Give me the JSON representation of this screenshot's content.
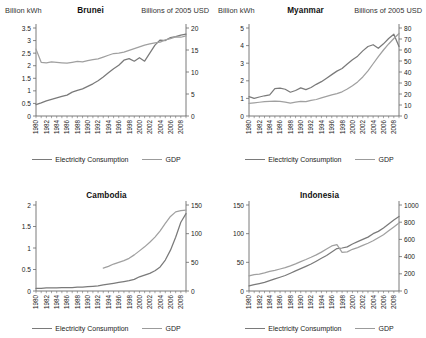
{
  "figure": {
    "axis_unit_left": "Billion kWh",
    "axis_unit_right": "Billions of 2005 USD",
    "legend": {
      "series_1": "Electricity Consumption",
      "series_2": "GDP"
    },
    "colors": {
      "electricity": "#7a7a7a",
      "gdp": "#a0a0a0",
      "axis": "#6b6b6b",
      "text": "#222222",
      "background": "#ffffff"
    }
  },
  "chart_data": [
    {
      "type": "line",
      "title": "Brunei",
      "xlabel": "",
      "ylabel": "Billion kWh",
      "y2label": "Billions of 2005 USD",
      "grid": false,
      "legend_position": "bottom",
      "x": [
        1980,
        1981,
        1982,
        1983,
        1984,
        1985,
        1986,
        1987,
        1988,
        1989,
        1990,
        1991,
        1992,
        1993,
        1994,
        1995,
        1996,
        1997,
        1998,
        1999,
        2000,
        2001,
        2002,
        2003,
        2004,
        2005,
        2006,
        2007,
        2008,
        2009
      ],
      "xticklabels": [
        "1980",
        "1982",
        "1984",
        "1986",
        "1988",
        "1990",
        "1992",
        "1994",
        "1996",
        "1998",
        "2000",
        "2002",
        "2004",
        "2006",
        "2008"
      ],
      "ylim": [
        0,
        3.5
      ],
      "yticks": [
        0,
        0.5,
        1,
        1.5,
        2,
        2.5,
        3,
        3.5
      ],
      "yticklabels": [
        "0",
        "0.5",
        "1",
        "1.5",
        "2",
        "2.5",
        "3",
        "3.5"
      ],
      "y2lim": [
        0,
        20
      ],
      "y2ticks": [
        0,
        5,
        10,
        15,
        20
      ],
      "y2ticklabels": [
        "0",
        "5",
        "10",
        "15",
        "20"
      ],
      "series": [
        {
          "name": "Electricity Consumption",
          "axis": "left",
          "values": [
            0.45,
            0.52,
            0.6,
            0.66,
            0.72,
            0.78,
            0.83,
            0.95,
            1.02,
            1.08,
            1.18,
            1.28,
            1.4,
            1.55,
            1.72,
            1.88,
            2.02,
            2.22,
            2.28,
            2.18,
            2.32,
            2.18,
            2.5,
            2.82,
            3.02,
            3.0,
            3.12,
            3.16,
            3.22,
            3.26
          ]
        },
        {
          "name": "GDP",
          "axis": "right",
          "values": [
            15.2,
            12.2,
            12.1,
            12.3,
            12.2,
            12.1,
            12.0,
            12.2,
            12.4,
            12.3,
            12.6,
            12.8,
            13.0,
            13.4,
            13.8,
            14.2,
            14.3,
            14.5,
            14.9,
            15.3,
            15.7,
            16.1,
            16.4,
            16.6,
            16.8,
            17.3,
            17.6,
            18.0,
            17.9,
            18.2
          ]
        }
      ]
    },
    {
      "type": "line",
      "title": "Myanmar",
      "xlabel": "",
      "ylabel": "Billion kWh",
      "y2label": "Billions of 2005 USD",
      "grid": false,
      "legend_position": "bottom",
      "x": [
        1980,
        1981,
        1982,
        1983,
        1984,
        1985,
        1986,
        1987,
        1988,
        1989,
        1990,
        1991,
        1992,
        1993,
        1994,
        1995,
        1996,
        1997,
        1998,
        1999,
        2000,
        2001,
        2002,
        2003,
        2004,
        2005,
        2006,
        2007,
        2008,
        2009
      ],
      "xticklabels": [
        "1980",
        "1982",
        "1984",
        "1986",
        "1988",
        "1990",
        "1992",
        "1994",
        "1996",
        "1998",
        "2000",
        "2002",
        "2004",
        "2006",
        "2008"
      ],
      "ylim": [
        0,
        5
      ],
      "yticks": [
        0,
        1,
        2,
        3,
        4,
        5
      ],
      "yticklabels": [
        "0",
        "1",
        "2",
        "3",
        "4",
        "5"
      ],
      "y2lim": [
        0,
        80
      ],
      "y2ticks": [
        0,
        10,
        20,
        30,
        40,
        50,
        60,
        70,
        80
      ],
      "y2ticklabels": [
        "0",
        "10",
        "20",
        "30",
        "40",
        "50",
        "60",
        "70",
        "80"
      ],
      "series": [
        {
          "name": "Electricity Consumption",
          "axis": "left",
          "values": [
            1.1,
            1.0,
            1.08,
            1.15,
            1.2,
            1.55,
            1.58,
            1.52,
            1.35,
            1.45,
            1.6,
            1.5,
            1.62,
            1.8,
            1.95,
            2.15,
            2.35,
            2.55,
            2.7,
            2.95,
            3.2,
            3.4,
            3.7,
            3.95,
            4.05,
            3.85,
            4.1,
            4.4,
            4.65,
            3.95
          ]
        },
        {
          "name": "GDP",
          "axis": "right",
          "values": [
            11.5,
            12.0,
            12.5,
            13.0,
            13.4,
            13.6,
            13.2,
            12.6,
            11.8,
            12.6,
            13.2,
            13.0,
            14.2,
            15.0,
            16.4,
            17.8,
            19.2,
            20.4,
            22.0,
            24.5,
            27.5,
            31.0,
            35.5,
            41.0,
            47.5,
            54.0,
            60.0,
            65.5,
            70.5,
            75.0
          ]
        }
      ]
    },
    {
      "type": "line",
      "title": "Cambodia",
      "xlabel": "",
      "ylabel": "Billion kWh",
      "y2label": "Billions of 2005 USD",
      "grid": false,
      "legend_position": "bottom",
      "x": [
        1980,
        1981,
        1982,
        1983,
        1984,
        1985,
        1986,
        1987,
        1988,
        1989,
        1990,
        1991,
        1992,
        1993,
        1994,
        1995,
        1996,
        1997,
        1998,
        1999,
        2000,
        2001,
        2002,
        2003,
        2004,
        2005,
        2006,
        2007,
        2008,
        2009
      ],
      "xticklabels": [
        "1980",
        "1982",
        "1984",
        "1986",
        "1988",
        "1990",
        "1992",
        "1994",
        "1996",
        "1998",
        "2000",
        "2002",
        "2004",
        "2006",
        "2008"
      ],
      "ylim": [
        0,
        2
      ],
      "yticks": [
        0,
        0.5,
        1,
        1.5,
        2
      ],
      "yticklabels": [
        "0",
        "0.5",
        "1",
        "1.5",
        "2"
      ],
      "y2lim": [
        0,
        150
      ],
      "y2ticks": [
        0,
        50,
        100,
        150
      ],
      "y2ticklabels": [
        "0",
        "50",
        "100",
        "150"
      ],
      "series": [
        {
          "name": "Electricity Consumption",
          "axis": "left",
          "values": [
            0.06,
            0.06,
            0.07,
            0.07,
            0.07,
            0.08,
            0.08,
            0.08,
            0.09,
            0.09,
            0.1,
            0.11,
            0.12,
            0.14,
            0.16,
            0.18,
            0.2,
            0.22,
            0.24,
            0.27,
            0.33,
            0.37,
            0.41,
            0.47,
            0.56,
            0.72,
            0.95,
            1.25,
            1.6,
            1.8
          ]
        },
        {
          "name": "GDP",
          "axis": "right",
          "values": [
            null,
            null,
            null,
            null,
            null,
            null,
            null,
            null,
            null,
            null,
            null,
            null,
            null,
            40.0,
            43.0,
            47.0,
            50.0,
            53.0,
            57.0,
            63.0,
            70.0,
            77.0,
            85.0,
            94.0,
            105.0,
            118.0,
            130.0,
            138.0,
            140.0,
            141.0
          ]
        }
      ]
    },
    {
      "type": "line",
      "title": "Indonesia",
      "xlabel": "",
      "ylabel": "Billion kWh",
      "y2label": "Billions of 2005 USD",
      "grid": false,
      "legend_position": "bottom",
      "x": [
        1980,
        1981,
        1982,
        1983,
        1984,
        1985,
        1986,
        1987,
        1988,
        1989,
        1990,
        1991,
        1992,
        1993,
        1994,
        1995,
        1996,
        1997,
        1998,
        1999,
        2000,
        2001,
        2002,
        2003,
        2004,
        2005,
        2006,
        2007,
        2008,
        2009
      ],
      "xticklabels": [
        "1980",
        "1982",
        "1984",
        "1986",
        "1988",
        "1990",
        "1992",
        "1994",
        "1996",
        "1998",
        "2000",
        "2002",
        "2004",
        "2006",
        "2008"
      ],
      "ylim": [
        0,
        150
      ],
      "yticks": [
        0,
        50,
        100,
        150
      ],
      "yticklabels": [
        "0",
        "50",
        "100",
        "150"
      ],
      "y2lim": [
        0,
        1000
      ],
      "y2ticks": [
        0,
        200,
        400,
        600,
        800,
        1000
      ],
      "y2ticklabels": [
        "0",
        "200",
        "400",
        "600",
        "800",
        "1000"
      ],
      "series": [
        {
          "name": "Electricity Consumption",
          "axis": "left",
          "values": [
            9,
            11,
            13,
            15,
            18,
            21,
            24,
            27,
            31,
            35,
            39,
            43,
            47,
            52,
            57,
            62,
            68,
            74,
            75,
            77,
            82,
            86,
            90,
            94,
            100,
            104,
            110,
            117,
            124,
            130
          ]
        },
        {
          "name": "GDP",
          "axis": "right",
          "values": [
            175,
            190,
            196,
            210,
            228,
            240,
            256,
            272,
            292,
            316,
            342,
            366,
            392,
            420,
            452,
            488,
            524,
            540,
            450,
            455,
            485,
            505,
            530,
            555,
            585,
            620,
            655,
            700,
            745,
            790
          ]
        }
      ]
    }
  ]
}
